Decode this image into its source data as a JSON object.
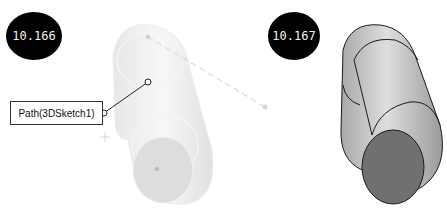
{
  "figures": [
    {
      "label": "10.166",
      "callout": "Path(3DSketch1)",
      "description": "translucent swept elbow preview with 3D sketch path"
    },
    {
      "label": "10.167",
      "description": "solid swept elbow body"
    }
  ],
  "colors": {
    "badge_bg": "#000000",
    "badge_text": "#f2f2f2",
    "preview_fill": "#e8e8e8",
    "solid_light": "#c8c8c8",
    "solid_dark": "#6e6e6e",
    "edge": "#1a1a1a"
  }
}
